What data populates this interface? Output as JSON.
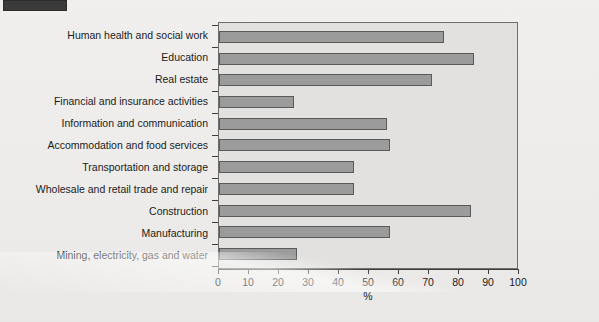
{
  "corner_mark": {
    "name": "crop-mark",
    "color": "#3a3a3a"
  },
  "colors": {
    "bar_fill": "#9b9b9b",
    "bar_edge": "#5a5a5a",
    "panel_background": "#e2e1df",
    "page_background": "#eeeeec",
    "axis": "#3d3d3d",
    "text": "#1b1b1b"
  },
  "chart_data": {
    "type": "bar",
    "orientation": "horizontal",
    "title": "",
    "subtitle": "",
    "xlabel": "%",
    "ylabel": "",
    "xlim": [
      0,
      100
    ],
    "xticks": [
      0,
      10,
      20,
      30,
      40,
      50,
      60,
      70,
      80,
      90,
      100
    ],
    "xtick_labels": [
      "0",
      "10",
      "20",
      "30",
      "40",
      "50",
      "60",
      "70",
      "80",
      "90",
      "100"
    ],
    "grid": false,
    "legend": false,
    "legend_position": "none",
    "categories": [
      "Human health and social work",
      "Education",
      "Real estate",
      "Financial and insurance activities",
      "Information and communication",
      "Accommodation and food services",
      "Transportation and storage",
      "Wholesale and retail trade and repair",
      "Construction",
      "Manufacturing",
      "Mining, electricity, gas and water"
    ],
    "values": [
      75,
      85,
      71,
      25,
      56,
      57,
      45,
      45,
      84,
      57,
      26
    ],
    "annotations": []
  }
}
